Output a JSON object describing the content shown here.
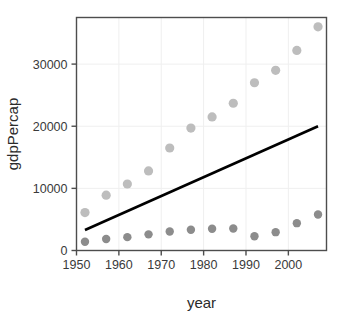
{
  "chart_data": {
    "type": "scatter",
    "title": "",
    "xlabel": "year",
    "ylabel": "gdpPercap",
    "xlim": [
      1950.0,
      2009.0
    ],
    "ylim": [
      0,
      37500
    ],
    "xticks": [
      1950,
      1960,
      1970,
      1980,
      1990,
      2000
    ],
    "xtick_labels": [
      "1950",
      "1960",
      "1970",
      "1980",
      "1990",
      "2000"
    ],
    "yticks": [
      0,
      10000,
      20000,
      30000
    ],
    "ytick_labels": [
      "0",
      "10000",
      "20000",
      "30000"
    ],
    "grid": true,
    "grid_color": "#efefef",
    "legend": "none",
    "panel_background": "#ffffff",
    "panel_border_color": "#4d4d4d",
    "x": [
      1952,
      1957,
      1962,
      1967,
      1972,
      1977,
      1982,
      1987,
      1992,
      1997,
      2002,
      2007
    ],
    "series": [
      {
        "name": "upper-series",
        "marker": "circle",
        "color": "#bdbdbd",
        "marker_size": 4.6,
        "values": [
          6100,
          8900,
          10700,
          12800,
          16500,
          19700,
          21500,
          23700,
          27000,
          29000,
          32200,
          36000
        ]
      },
      {
        "name": "lower-series",
        "marker": "circle",
        "color": "#8c8c8c",
        "marker_size": 4.2,
        "values": [
          1400,
          1850,
          2150,
          2600,
          3050,
          3350,
          3500,
          3550,
          2300,
          2950,
          4400,
          5800
        ]
      }
    ],
    "annotations": [
      {
        "name": "trend-line",
        "type": "line",
        "color": "#000000",
        "width": 2.6,
        "x0": 1952,
        "y0": 3300,
        "x1": 2007,
        "y1": 20000
      }
    ]
  }
}
